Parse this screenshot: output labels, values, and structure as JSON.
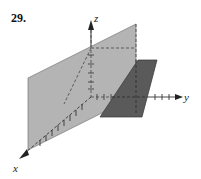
{
  "problem": {
    "number": "29."
  },
  "figure": {
    "type": "3d-planes",
    "axes": {
      "x_label": "x",
      "y_label": "y",
      "z_label": "z"
    },
    "colors": {
      "light_plane": "#b4b4b4",
      "dark_plane": "#5a5a5a",
      "axis": "#333333",
      "dashed": "#444444"
    }
  }
}
